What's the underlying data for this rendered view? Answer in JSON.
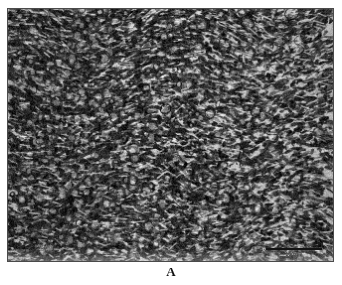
{
  "figure": {
    "name": "histopathology-micrograph",
    "panel_label": "A",
    "modality": "light-microscopy-histology",
    "stain": "hematoxylin-and-eosin",
    "color_mode": "grayscale"
  },
  "micrograph": {
    "name": "tissue-field",
    "border_color": "#4a4a4a",
    "background_color": "#cfcfcf",
    "dark_tone": "#1a1a1a",
    "mid_tone": "#7d7d7d",
    "light_tone": "#ededed",
    "frame": {
      "left": 7,
      "top": 8,
      "width": 327,
      "height": 254
    }
  },
  "scale_bar": {
    "name": "scale-bar",
    "label": "100 µm",
    "bar_color": "#141414",
    "bar_length_px": 56,
    "position": "bottom-right"
  },
  "page": {
    "background": "#ffffff",
    "width": 342,
    "height": 285
  }
}
